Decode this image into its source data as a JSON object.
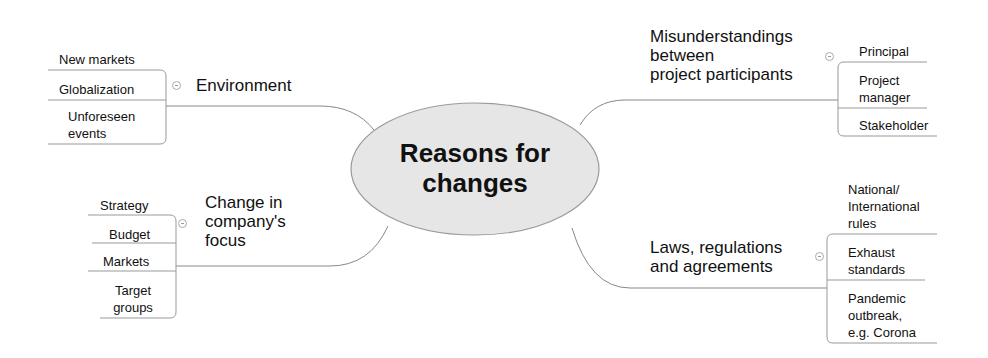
{
  "central_topic": {
    "label_line1": "Reasons for",
    "label_line2": "changes",
    "fill_color": "#e6e6e6",
    "stroke_color": "#999999"
  },
  "branches": [
    {
      "id": "environment",
      "label": "Environment",
      "leaves": [
        "New markets",
        "Globalization",
        "Unforeseen",
        "events"
      ]
    },
    {
      "id": "company-focus",
      "label_lines": [
        "Change in",
        "company's",
        "focus"
      ],
      "leaves": [
        "Strategy",
        "Budget",
        "Markets",
        "Target",
        "groups"
      ]
    },
    {
      "id": "misunderstandings",
      "label_lines": [
        "Misunderstandings",
        "between",
        "project participants"
      ],
      "leaves": [
        "Principal",
        "Project",
        "manager",
        "Stakeholder"
      ]
    },
    {
      "id": "laws",
      "label_lines": [
        "Laws, regulations",
        "and agreements"
      ],
      "leaves": [
        "National/",
        "International",
        "rules",
        "Exhaust",
        "standards",
        "Pandemic",
        "outbreak,",
        "e.g. Corona"
      ]
    }
  ],
  "colors": {
    "line": "#888888",
    "text": "#111111",
    "background": "#ffffff"
  }
}
